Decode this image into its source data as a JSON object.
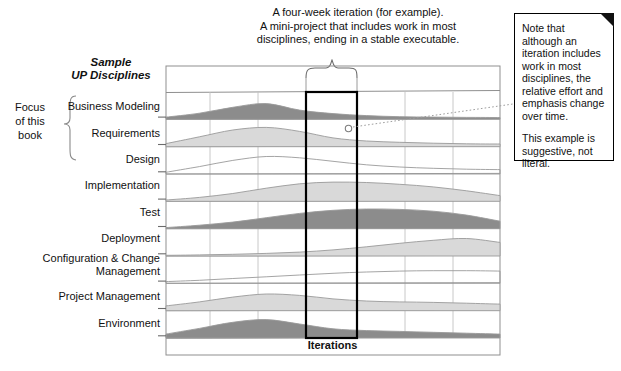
{
  "figure": {
    "top_annotation": [
      "A four-week iteration (for example).",
      "A mini-project that includes work in most",
      "disciplines, ending in a stable executable."
    ],
    "sample_title_line1": "Sample",
    "sample_title_line2": "UP Disciplines",
    "focus_label": [
      "Focus",
      "of this",
      "book"
    ],
    "x_axis_label": "Iterations",
    "note_box": {
      "paragraph1": "Note that although an iteration includes work in most disciplines, the relative effort and emphasis change over time.",
      "paragraph2": "This example is suggestive, not literal."
    },
    "colors": {
      "dark_fill": "#8c8c8c",
      "light_fill": "#d9d9d9",
      "grid": "#b6b6b6",
      "frame": "#8f8f8f",
      "highlight": "#000000"
    }
  },
  "chart_data": {
    "type": "area",
    "title": "Sample UP Disciplines",
    "xlabel": "Iterations",
    "ylabel": "",
    "grid": true,
    "legend": "none",
    "x": [
      0,
      1,
      2,
      3,
      4,
      5,
      6,
      7,
      8,
      9,
      10
    ],
    "xlim": [
      0,
      10
    ],
    "ylim": [
      0,
      1
    ],
    "iteration_highlight": {
      "from": 4.1,
      "to": 5.7,
      "label": "one iteration"
    },
    "series": [
      {
        "name": "Business Modeling",
        "shade": "dark",
        "values": [
          0.1,
          0.28,
          0.55,
          0.72,
          0.42,
          0.26,
          0.17,
          0.12,
          0.1,
          0.09,
          0.08
        ]
      },
      {
        "name": "Requirements",
        "shade": "light",
        "values": [
          0.14,
          0.45,
          0.76,
          0.88,
          0.7,
          0.4,
          0.26,
          0.2,
          0.16,
          0.13,
          0.12
        ]
      },
      {
        "name": "Design",
        "shade": "none",
        "values": [
          0.08,
          0.34,
          0.62,
          0.8,
          0.74,
          0.58,
          0.42,
          0.32,
          0.26,
          0.22,
          0.2
        ]
      },
      {
        "name": "Implementation",
        "shade": "light",
        "values": [
          0.06,
          0.18,
          0.36,
          0.6,
          0.8,
          0.88,
          0.86,
          0.78,
          0.66,
          0.48,
          0.26
        ]
      },
      {
        "name": "Test",
        "shade": "dark",
        "values": [
          0.05,
          0.16,
          0.3,
          0.5,
          0.7,
          0.84,
          0.9,
          0.88,
          0.8,
          0.62,
          0.34
        ]
      },
      {
        "name": "Deployment",
        "shade": "light",
        "values": [
          0.03,
          0.05,
          0.08,
          0.12,
          0.18,
          0.28,
          0.42,
          0.58,
          0.72,
          0.8,
          0.62
        ]
      },
      {
        "name": "Configuration & Change Management",
        "shade": "none",
        "values": [
          0.08,
          0.14,
          0.22,
          0.3,
          0.38,
          0.46,
          0.52,
          0.56,
          0.58,
          0.58,
          0.56
        ]
      },
      {
        "name": "Project Management",
        "shade": "light",
        "values": [
          0.22,
          0.4,
          0.62,
          0.76,
          0.7,
          0.54,
          0.44,
          0.4,
          0.38,
          0.34,
          0.3
        ]
      },
      {
        "name": "Environment",
        "shade": "dark",
        "values": [
          0.18,
          0.44,
          0.72,
          0.84,
          0.64,
          0.42,
          0.34,
          0.3,
          0.26,
          0.22,
          0.18
        ]
      }
    ],
    "row_labels": [
      "Business Modeling",
      "Requirements",
      "Design",
      "Implementation",
      "Test",
      "Deployment",
      "Configuration & Change\nManagement",
      "Project Management",
      "Environment"
    ],
    "focus_rows": [
      "Business Modeling",
      "Requirements",
      "Design"
    ]
  }
}
